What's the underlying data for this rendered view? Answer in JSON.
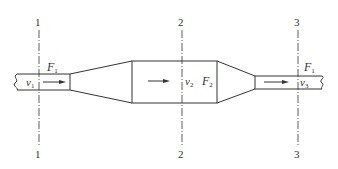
{
  "diagram": {
    "type": "pipe-flow-sections",
    "colors": {
      "stroke": "#333333",
      "background": "#ffffff"
    },
    "sections": [
      {
        "id": "1",
        "top_label": "1",
        "bottom_label": "1"
      },
      {
        "id": "2",
        "top_label": "2",
        "bottom_label": "2"
      },
      {
        "id": "3",
        "top_label": "3",
        "bottom_label": "3"
      }
    ],
    "labels": {
      "area_left": {
        "base": "F",
        "sub": "1"
      },
      "vel_left": {
        "base": "v",
        "sub": "1"
      },
      "vel_mid": {
        "base": "v",
        "sub": "2"
      },
      "area_mid": {
        "base": "F",
        "sub": "2"
      },
      "area_right": {
        "base": "F",
        "sub": "1"
      },
      "vel_right": {
        "base": "v",
        "sub": "3"
      }
    },
    "flow_direction": "left-to-right"
  }
}
